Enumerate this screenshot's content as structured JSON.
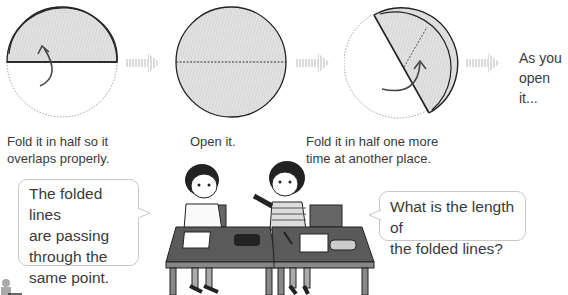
{
  "steps": [
    {
      "caption_line1": "Fold it in half so it",
      "caption_line2": "overlaps properly."
    },
    {
      "caption_line1": "Open it.",
      "caption_line2": ""
    },
    {
      "caption_line1": "Fold it in half one more",
      "caption_line2": "time at another place."
    }
  ],
  "next_step_text": {
    "line1": "As you",
    "line2": "open it..."
  },
  "bubbles": {
    "left": {
      "line1": "The folded lines",
      "line2": "are passing",
      "line3": "through the",
      "line4": "same point."
    },
    "right": {
      "line1": "What is the length of",
      "line2": "the folded lines?"
    }
  },
  "icons": {
    "step_arrow": "hatched-right-arrow-icon",
    "fold_arrow": "curved-arrow-icon"
  },
  "colors": {
    "paper_fill": "#dcdcdc",
    "outline": "#222222",
    "arrow": "#d0d0d0",
    "bubble_border": "#c8c8c8",
    "desk": "#555555"
  }
}
